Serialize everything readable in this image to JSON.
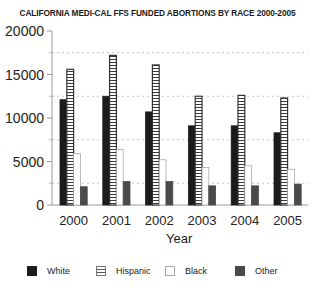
{
  "chart_data": {
    "type": "bar",
    "title": "CALIFORNIA MEDI-CAL FFS FUNDED ABORTIONS BY RACE 2000-2005",
    "xlabel": "Year",
    "ylabel": "",
    "categories": [
      "2000",
      "2001",
      "2002",
      "2003",
      "2004",
      "2005"
    ],
    "series": [
      {
        "name": "White",
        "values": [
          12100,
          12500,
          10700,
          9100,
          9100,
          8300
        ]
      },
      {
        "name": "Hispanic",
        "values": [
          15600,
          17200,
          16100,
          12500,
          12600,
          12300
        ]
      },
      {
        "name": "Black",
        "values": [
          5900,
          6400,
          5200,
          4300,
          4500,
          4100
        ]
      },
      {
        "name": "Other",
        "values": [
          2100,
          2700,
          2700,
          2200,
          2200,
          2400
        ]
      }
    ],
    "ylim": [
      0,
      20000
    ],
    "yticks": [
      "0",
      "5000",
      "10000",
      "15000",
      "20000"
    ],
    "grid": "dashed horizontal at 2500, 7500, 12500, 17500",
    "legend_position": "bottom"
  },
  "legend": {
    "items": [
      {
        "label": "White"
      },
      {
        "label": "Hispanic"
      },
      {
        "label": "Black"
      },
      {
        "label": "Other"
      }
    ]
  }
}
